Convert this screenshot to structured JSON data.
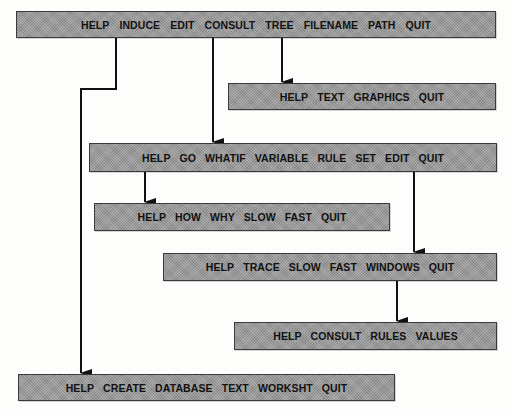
{
  "diagram": {
    "type": "menu-hierarchy",
    "colors": {
      "bar_fill": "#9a9a9a",
      "bar_border": "#3a3a3a",
      "text": "#111111",
      "connector": "#111111"
    },
    "menus": {
      "main": {
        "items": [
          "HELP",
          "INDUCE",
          "EDIT",
          "CONSULT",
          "TREE",
          "FILENAME",
          "PATH",
          "QUIT"
        ]
      },
      "tree": {
        "parent": "main.TREE",
        "items": [
          "HELP",
          "TEXT",
          "GRAPHICS",
          "QUIT"
        ]
      },
      "consult": {
        "parent": "main.CONSULT",
        "items": [
          "HELP",
          "GO",
          "WHATIF",
          "VARIABLE",
          "RULE",
          "SET",
          "EDIT",
          "QUIT"
        ]
      },
      "go": {
        "parent": "consult.GO",
        "items": [
          "HELP",
          "HOW",
          "WHY",
          "SLOW",
          "FAST",
          "QUIT"
        ]
      },
      "consult_edit": {
        "parent": "consult.EDIT",
        "items": [
          "HELP",
          "TRACE",
          "SLOW",
          "FAST",
          "WINDOWS",
          "QUIT"
        ]
      },
      "windows": {
        "parent": "consult_edit.WINDOWS",
        "items": [
          "HELP",
          "CONSULT",
          "RULES",
          "VALUES"
        ]
      },
      "induce": {
        "parent": "main.INDUCE",
        "items": [
          "HELP",
          "CREATE",
          "DATABASE",
          "TEXT",
          "WORKSHT",
          "QUIT"
        ]
      }
    }
  }
}
